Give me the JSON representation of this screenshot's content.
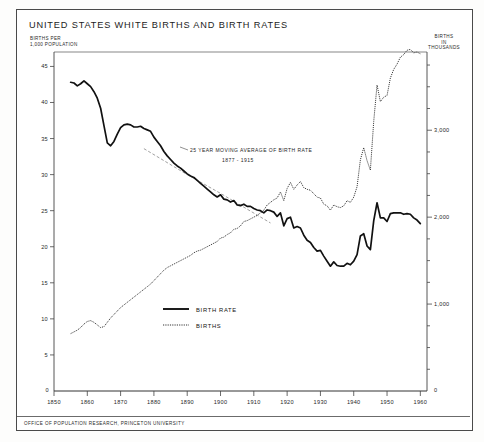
{
  "title": "UNITED STATES  WHITE BIRTHS AND BIRTH RATES",
  "footer": "OFFICE OF POPULATION RESEARCH, PRINCETON UNIVERSITY",
  "axis_caption_left": "BIRTHS PER\n1,000 POPULATION",
  "axis_caption_left_line1": "BIRTHS PER",
  "axis_caption_left_line2": "1,000 POPULATION",
  "axis_caption_right_line1": "BIRTHS",
  "axis_caption_right_line2": "IN",
  "axis_caption_right_line3": "THOUSANDS",
  "origin_label": "0",
  "right_origin_label": "0",
  "annotation": {
    "line1": "25 YEAR MOVING AVERAGE OF BIRTH RATE",
    "line2": "1877 - 1915"
  },
  "legend": {
    "items": [
      {
        "label": "BIRTH RATE",
        "style": "solid",
        "color": "#111111"
      },
      {
        "label": "BIRTHS",
        "style": "dotted",
        "color": "#333333"
      }
    ]
  },
  "chart_data": {
    "type": "line",
    "title": "UNITED STATES  WHITE BIRTHS AND BIRTH RATES",
    "xlabel": "",
    "ylabel": "BIRTHS PER 1,000 POPULATION",
    "y2label": "BIRTHS IN THOUSANDS",
    "xlim": [
      1850,
      1962
    ],
    "ylim": [
      0,
      47
    ],
    "y2lim": [
      0,
      3900
    ],
    "grid": false,
    "legend_position": "center-left-lower",
    "xticks": [
      1850,
      1860,
      1870,
      1880,
      1890,
      1900,
      1910,
      1920,
      1930,
      1940,
      1950,
      1960
    ],
    "xtick_labels": [
      "1850",
      "1860",
      "1870",
      "1880",
      "1890",
      "1900",
      "1910",
      "1920",
      "1930",
      "1940",
      "1950",
      "1960"
    ],
    "yticks": [
      5,
      10,
      15,
      20,
      25,
      30,
      35,
      40,
      45
    ],
    "ytick_labels": [
      "5",
      "10",
      "15",
      "20",
      "25",
      "30",
      "35",
      "40",
      "45"
    ],
    "y2ticks": [
      1000,
      2000,
      3000
    ],
    "y2tick_labels": [
      "1,000",
      "2,000",
      "3,000"
    ],
    "y2minor_step": 250,
    "series": [
      {
        "name": "BIRTH RATE",
        "style": "solid",
        "axis": "left",
        "units": "births per 1,000 population",
        "x": [
          1855,
          1856,
          1857,
          1858,
          1859,
          1860,
          1861,
          1862,
          1863,
          1864,
          1865,
          1866,
          1867,
          1868,
          1869,
          1870,
          1871,
          1872,
          1873,
          1874,
          1875,
          1876,
          1877,
          1878,
          1879,
          1880,
          1881,
          1882,
          1883,
          1884,
          1885,
          1886,
          1887,
          1888,
          1889,
          1890,
          1891,
          1892,
          1893,
          1894,
          1895,
          1896,
          1897,
          1898,
          1899,
          1900,
          1901,
          1902,
          1903,
          1904,
          1905,
          1906,
          1907,
          1908,
          1909,
          1910,
          1911,
          1912,
          1913,
          1914,
          1915,
          1916,
          1917,
          1918,
          1919,
          1920,
          1921,
          1922,
          1923,
          1924,
          1925,
          1926,
          1927,
          1928,
          1929,
          1930,
          1931,
          1932,
          1933,
          1934,
          1935,
          1936,
          1937,
          1938,
          1939,
          1940,
          1941,
          1942,
          1943,
          1944,
          1945,
          1946,
          1947,
          1948,
          1949,
          1950,
          1951,
          1952,
          1953,
          1954,
          1955,
          1956,
          1957,
          1958,
          1959,
          1960
        ],
        "y": [
          42.8,
          42.7,
          42.3,
          42.6,
          43.0,
          42.6,
          42.2,
          41.5,
          40.6,
          39.2,
          36.8,
          34.4,
          34.0,
          34.6,
          35.6,
          36.5,
          36.9,
          37.0,
          36.9,
          36.6,
          36.6,
          36.7,
          36.4,
          36.2,
          36.0,
          35.2,
          34.6,
          34.0,
          33.2,
          32.6,
          32.1,
          31.6,
          31.2,
          30.9,
          30.5,
          30.1,
          29.8,
          29.6,
          29.2,
          28.8,
          28.4,
          28.0,
          27.6,
          27.2,
          26.9,
          27.2,
          26.6,
          26.5,
          26.2,
          26.4,
          25.8,
          25.7,
          25.9,
          25.6,
          25.6,
          25.3,
          25.1,
          25.0,
          24.7,
          25.1,
          25.0,
          24.8,
          24.2,
          24.7,
          22.9,
          23.9,
          24.1,
          22.6,
          22.8,
          22.6,
          21.6,
          20.9,
          20.6,
          19.9,
          19.4,
          19.5,
          18.7,
          18.0,
          17.3,
          17.9,
          17.4,
          17.3,
          17.3,
          17.7,
          17.5,
          18.0,
          18.9,
          21.5,
          21.8,
          20.1,
          19.6,
          23.6,
          26.1,
          24.0,
          24.0,
          23.5,
          24.6,
          24.7,
          24.7,
          24.7,
          24.5,
          24.6,
          24.5,
          24.0,
          23.7,
          23.2
        ]
      },
      {
        "name": "BIRTHS",
        "style": "dotted",
        "axis": "right",
        "units": "thousands of births",
        "x": [
          1855,
          1856,
          1857,
          1858,
          1859,
          1860,
          1861,
          1862,
          1863,
          1864,
          1865,
          1866,
          1867,
          1868,
          1869,
          1870,
          1871,
          1872,
          1873,
          1874,
          1875,
          1876,
          1877,
          1878,
          1879,
          1880,
          1881,
          1882,
          1883,
          1884,
          1885,
          1886,
          1887,
          1888,
          1889,
          1890,
          1891,
          1892,
          1893,
          1894,
          1895,
          1896,
          1897,
          1898,
          1899,
          1900,
          1901,
          1902,
          1903,
          1904,
          1905,
          1906,
          1907,
          1908,
          1909,
          1910,
          1911,
          1912,
          1913,
          1914,
          1915,
          1916,
          1917,
          1918,
          1919,
          1920,
          1921,
          1922,
          1923,
          1924,
          1925,
          1926,
          1927,
          1928,
          1929,
          1930,
          1931,
          1932,
          1933,
          1934,
          1935,
          1936,
          1937,
          1938,
          1939,
          1940,
          1941,
          1942,
          1943,
          1944,
          1945,
          1946,
          1947,
          1948,
          1949,
          1950,
          1951,
          1952,
          1953,
          1954,
          1955,
          1956,
          1957,
          1958,
          1959,
          1960
        ],
        "y": [
          660,
          680,
          700,
          730,
          770,
          800,
          810,
          790,
          760,
          730,
          740,
          790,
          840,
          880,
          920,
          960,
          990,
          1020,
          1050,
          1080,
          1110,
          1140,
          1170,
          1200,
          1230,
          1270,
          1310,
          1350,
          1390,
          1420,
          1440,
          1460,
          1480,
          1500,
          1520,
          1540,
          1560,
          1590,
          1610,
          1620,
          1640,
          1660,
          1680,
          1700,
          1720,
          1760,
          1770,
          1800,
          1820,
          1860,
          1870,
          1900,
          1950,
          1960,
          1980,
          2000,
          2020,
          2050,
          2080,
          2140,
          2170,
          2200,
          2220,
          2290,
          2190,
          2330,
          2400,
          2320,
          2370,
          2410,
          2340,
          2320,
          2310,
          2270,
          2230,
          2220,
          2150,
          2130,
          2080,
          2140,
          2120,
          2110,
          2130,
          2190,
          2170,
          2230,
          2350,
          2660,
          2800,
          2650,
          2540,
          3100,
          3520,
          3330,
          3380,
          3400,
          3600,
          3700,
          3760,
          3840,
          3870,
          3920,
          3930,
          3890,
          3900,
          3880
        ]
      },
      {
        "name": "25 YEAR MOVING AVERAGE OF BIRTH RATE 1877 - 1915",
        "style": "thin-trend",
        "axis": "left",
        "units": "births per 1,000 population",
        "x": [
          1877,
          1890,
          1900,
          1915
        ],
        "y": [
          33.6,
          30.0,
          27.4,
          23.3
        ]
      }
    ]
  }
}
